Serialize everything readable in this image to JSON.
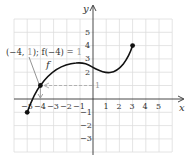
{
  "graph": {
    "x_axis_label": "x",
    "y_axis_label": "y",
    "function_label": "f",
    "x_ticks": [
      "−5",
      "−4",
      "−3",
      "−2",
      "−1",
      "1",
      "2",
      "3",
      "4",
      "5"
    ],
    "y_ticks": [
      "5",
      "4",
      "3",
      "2",
      "−1",
      "−2",
      "−3"
    ],
    "annotation": {
      "point_text": "(−4, ",
      "point_y": "1",
      "mid_text": "); f(−4) = ",
      "value": "1",
      "y_axis_marker": "1"
    },
    "endpoints": [
      {
        "x": -5,
        "y": -1
      },
      {
        "x": 3,
        "y": 4
      }
    ],
    "highlight_point": {
      "x": -4,
      "y": 1
    },
    "colors": {
      "curve": "#111111",
      "grid": "#dddddd",
      "axis": "#333333",
      "dashed": "#aaaaaa",
      "annotation_gray": "#999999"
    }
  }
}
